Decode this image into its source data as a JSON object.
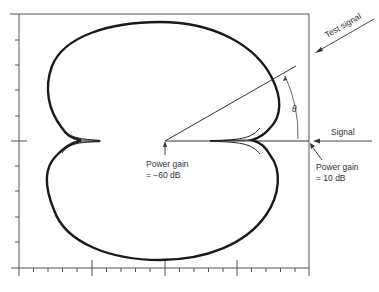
{
  "diagram": {
    "type": "polar-pattern",
    "labels": {
      "test_signal": "Test signal",
      "signal": "Signal",
      "theta": "θ",
      "center_gain_line1": "Power gain",
      "center_gain_line2": "= −60 dB",
      "edge_gain_line1": "Power gain",
      "edge_gain_line2": "= 10 dB"
    },
    "axes": {
      "left_axis_ticks": 10,
      "bottom_axis_ticks": 20,
      "bottom_major_ticks": 5
    },
    "colors": {
      "line": "#333333",
      "curve": "#1a1a1a",
      "background": "#ffffff"
    }
  }
}
